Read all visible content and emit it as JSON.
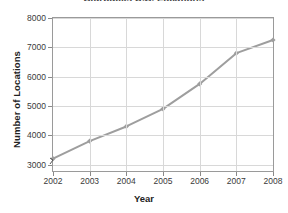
{
  "chart_data": {
    "type": "line",
    "title": "Starbucks U.S. Locations",
    "title_note": "cropped at top edge of image",
    "xlabel": "Year",
    "ylabel": "Number of Locations",
    "categories": [
      "2002",
      "2003",
      "2004",
      "2005",
      "2006",
      "2007",
      "2008"
    ],
    "x": [
      2002,
      2003,
      2004,
      2005,
      2006,
      2007,
      2008
    ],
    "values": [
      3200,
      3800,
      4300,
      4900,
      5750,
      6800,
      7250
    ],
    "series": [
      {
        "name": "Number of Locations",
        "values": [
          3200,
          3800,
          4300,
          4900,
          5750,
          6800,
          7250
        ]
      }
    ],
    "yticks": [
      3000,
      4000,
      5000,
      6000,
      7000,
      8000
    ],
    "ytick_labels": [
      "3000",
      "4000",
      "5000",
      "6000",
      "7000",
      "8000"
    ],
    "xtick_labels": [
      "2002",
      "2003",
      "2004",
      "2005",
      "2006",
      "2007",
      "2008"
    ],
    "ylim": [
      2780,
      8000
    ],
    "xlim": [
      2002,
      2008
    ],
    "grid": true,
    "legend": false,
    "legend_position": "none",
    "axis_break": true,
    "axis_break_axis": "y",
    "markers": "diamond",
    "line_color": "#9e9e9e",
    "marker_color": "#9e9e9e",
    "grid_color": "#d8d8d8",
    "axis_color": "#9a9a9a",
    "background": "#ffffff"
  }
}
